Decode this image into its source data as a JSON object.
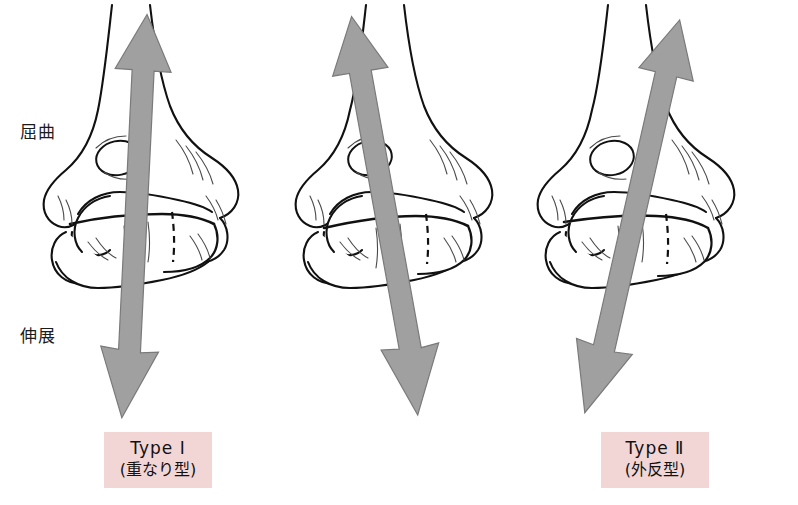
{
  "figure": {
    "background_color": "#ffffff"
  },
  "axis_labels": {
    "flexion": "屈曲",
    "extension": "伸展"
  },
  "colors": {
    "arrow_fill": "#a0a0a0",
    "arrow_stroke": "#6f6f6f",
    "bone_outline": "#111111",
    "bone_fill": "#ffffff",
    "caption_background": "#f2d6d6",
    "text": "#111111"
  },
  "panels": [
    {
      "id": "type-1",
      "caption_type": "Type Ⅰ",
      "caption_sub": "(重なり型)",
      "arrow_name": "force-arrow-type-1",
      "arrow_tilt_deg": 4
    },
    {
      "id": "type-2",
      "caption_type": "Type Ⅱ",
      "caption_sub": "(外反型)",
      "arrow_name": "force-arrow-type-2",
      "arrow_tilt_deg": -9
    },
    {
      "id": "type-3",
      "caption_type": "Type Ⅲ",
      "caption_sub": "(内反型)",
      "arrow_name": "force-arrow-type-3",
      "arrow_tilt_deg": 14
    }
  ]
}
